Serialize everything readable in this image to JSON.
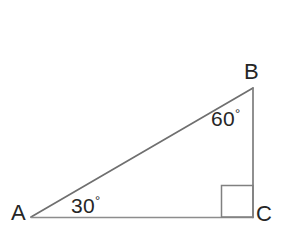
{
  "figure": {
    "type": "right-triangle-diagram",
    "background_color": "#ffffff",
    "line_color": "#7a7a7a",
    "text_color": "#262626",
    "canvas": {
      "width": 285,
      "height": 245
    },
    "vertices": [
      {
        "name": "A",
        "label": "A",
        "x": 31,
        "y": 217
      },
      {
        "name": "B",
        "label": "B",
        "x": 253,
        "y": 88
      },
      {
        "name": "C",
        "label": "C",
        "x": 253,
        "y": 217
      }
    ],
    "sides": [
      {
        "name": "hypotenuse-ab",
        "from": "A",
        "to": "B"
      },
      {
        "name": "side-bc",
        "from": "B",
        "to": "C"
      },
      {
        "name": "side-ac",
        "from": "A",
        "to": "C"
      }
    ],
    "angles": [
      {
        "at": "A",
        "value": "30",
        "degree_symbol": "°",
        "text": "30°"
      },
      {
        "at": "B",
        "value": "60",
        "degree_symbol": "°",
        "text": "60°"
      },
      {
        "at": "C",
        "value": "90",
        "marker": "right-angle-square"
      }
    ],
    "right_angle_marker": {
      "x": 221,
      "y": 185,
      "size": 32
    }
  }
}
